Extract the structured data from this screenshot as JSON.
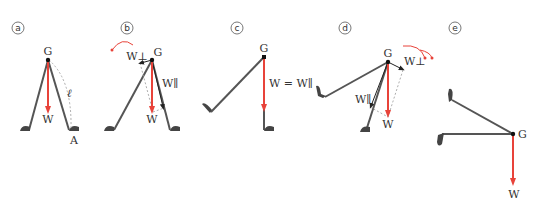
{
  "colors": {
    "leg": "#555555",
    "weight_arrow": "#e8433a",
    "dashed": "#999999",
    "point": "#111111",
    "text": "#333333"
  },
  "panels": [
    {
      "id": "a",
      "label": "a",
      "texts": {
        "g": "G",
        "w": "W",
        "ell": "ℓ",
        "a": "A"
      }
    },
    {
      "id": "b",
      "label": "b",
      "texts": {
        "g": "G",
        "w": "W",
        "w_perp": "W⊥",
        "w_par": "W∥"
      }
    },
    {
      "id": "c",
      "label": "c",
      "texts": {
        "g": "G",
        "eq": "W = W∥"
      }
    },
    {
      "id": "d",
      "label": "d",
      "texts": {
        "g": "G",
        "w": "W",
        "w_perp": "W⊥",
        "w_par": "W∥"
      }
    },
    {
      "id": "e",
      "label": "e",
      "texts": {
        "g": "G",
        "w": "W"
      }
    }
  ]
}
